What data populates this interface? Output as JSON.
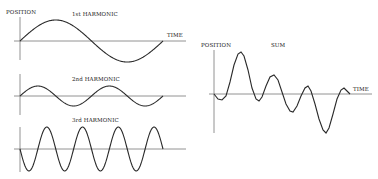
{
  "diagram": {
    "panels": [
      {
        "id": "h1",
        "title": "1st HARMONIC",
        "y_label": "POSITION",
        "x_label": "TIME",
        "cycles": 1,
        "amplitude": 21,
        "start_phase": "up"
      },
      {
        "id": "h2",
        "title": "2nd HARMONIC",
        "cycles": 2,
        "amplitude": 10,
        "start_phase": "up"
      },
      {
        "id": "h3",
        "title": "3rd HARMONIC",
        "cycles": 4,
        "amplitude": 22,
        "start_phase": "down"
      },
      {
        "id": "sum",
        "title": "SUM",
        "y_label": "POSITION",
        "x_label": "TIME"
      }
    ],
    "colors": {
      "curve": "#2a2a2a",
      "axis": "#777777",
      "background": "#ffffff"
    }
  }
}
